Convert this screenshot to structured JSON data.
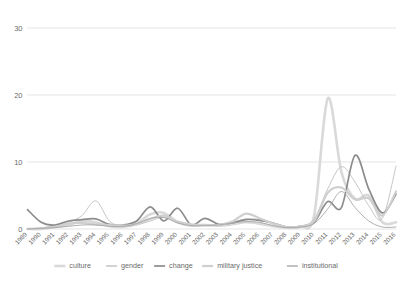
{
  "chart_data": {
    "type": "line",
    "title": "",
    "subtitle": "",
    "xlabel": "",
    "ylabel": "",
    "ylim": [
      0,
      30
    ],
    "yticks": [
      0,
      10,
      20,
      30
    ],
    "grid": true,
    "legend_position": "bottom",
    "smoothing": "spline",
    "categories": [
      "1989",
      "1990",
      "1991",
      "1992",
      "1993",
      "1994",
      "1995",
      "1996",
      "1997",
      "1998",
      "1999",
      "2000",
      "2001",
      "2002",
      "2003",
      "2004",
      "2005",
      "2006",
      "2007",
      "2008",
      "2009",
      "2010",
      "2011",
      "2012",
      "2013",
      "2014",
      "2015",
      "2016"
    ],
    "series": [
      {
        "name": "culture",
        "color": "#d9d9d9",
        "width": 2.6,
        "dash": "none",
        "values": [
          0,
          0,
          0.3,
          0.6,
          1.2,
          1.0,
          0.4,
          0.3,
          0.8,
          2.2,
          2.4,
          1.0,
          0.5,
          0.6,
          0.5,
          0.7,
          1.0,
          0.8,
          0.4,
          0.2,
          0.3,
          2.0,
          19.5,
          8.5,
          4.5,
          5.0,
          1.0,
          1.0
        ]
      },
      {
        "name": "gender",
        "color": "#bfbfbf",
        "width": 0.9,
        "dash": "none",
        "values": [
          0,
          0.2,
          0.5,
          1.0,
          2.0,
          4.2,
          1.2,
          0.4,
          0.6,
          1.2,
          1.8,
          1.0,
          0.6,
          0.5,
          0.7,
          1.0,
          1.5,
          1.4,
          0.8,
          0.3,
          0.4,
          1.5,
          6.0,
          9.3,
          7.0,
          3.5,
          1.6,
          9.4
        ]
      },
      {
        "name": "change",
        "color": "#8c8c8c",
        "width": 1.7,
        "dash": "none",
        "values": [
          2.9,
          1.0,
          0.6,
          1.2,
          1.4,
          1.5,
          0.7,
          0.6,
          1.2,
          3.3,
          1.2,
          3.1,
          0.6,
          1.6,
          0.7,
          0.9,
          1.4,
          1.3,
          0.9,
          0.3,
          0.4,
          1.0,
          4.1,
          3.2,
          11.0,
          6.0,
          2.4,
          5.2
        ]
      },
      {
        "name": "military justice",
        "color": "#cfcfcf",
        "width": 2.2,
        "dash": "none",
        "values": [
          0,
          0.1,
          0.3,
          0.8,
          0.9,
          0.7,
          0.6,
          0.5,
          0.7,
          1.5,
          2.0,
          1.1,
          0.7,
          0.6,
          0.6,
          1.1,
          2.3,
          1.6,
          0.8,
          0.3,
          0.4,
          1.2,
          5.4,
          6.2,
          4.4,
          4.6,
          2.0,
          5.6
        ]
      },
      {
        "name": "institutional",
        "color": "#a6a6a6",
        "width": 0.9,
        "dash": "none",
        "values": [
          0,
          0.1,
          0.2,
          0.4,
          0.6,
          0.6,
          0.4,
          0.4,
          0.8,
          1.6,
          1.7,
          0.9,
          0.5,
          0.5,
          0.6,
          0.9,
          1.1,
          1.0,
          0.5,
          0.2,
          0.3,
          0.8,
          3.0,
          5.6,
          3.2,
          1.2,
          0.3,
          0.3
        ]
      }
    ]
  },
  "legend": {
    "items": [
      {
        "label": "culture"
      },
      {
        "label": "gender"
      },
      {
        "label": "change"
      },
      {
        "label": "military justice"
      },
      {
        "label": "institutional"
      }
    ]
  },
  "axes": {
    "y_tick_labels": [
      "30",
      "20",
      "10",
      "0"
    ],
    "x_tick_labels": [
      "1989",
      "1990",
      "1991",
      "1992",
      "1993",
      "1994",
      "1995",
      "1996",
      "1997",
      "1998",
      "1999",
      "2000",
      "2001",
      "2002",
      "2003",
      "2004",
      "2005",
      "2006",
      "2007",
      "2008",
      "2009",
      "2010",
      "2011",
      "2012",
      "2013",
      "2014",
      "2015",
      "2016"
    ]
  }
}
